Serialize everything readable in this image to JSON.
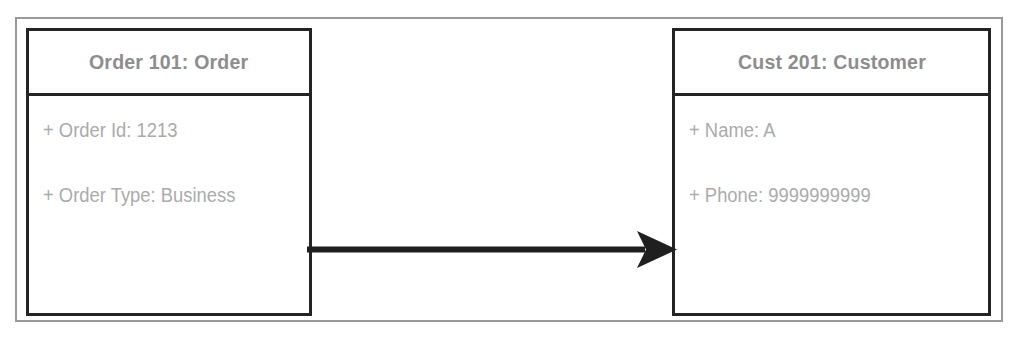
{
  "diagram": {
    "type": "uml-object-diagram",
    "background_color": "#ffffff",
    "frame_color": "#9a9a9a",
    "border_color": "#242424",
    "header_text_color": "#8d8d8d",
    "attribute_text_color": "#ababab",
    "connector_color": "#1f1f1f"
  },
  "objects": [
    {
      "id": "order",
      "header": "Order 101: Order",
      "attributes": [
        "+ Order Id: 1213",
        "+ Order Type: Business"
      ]
    },
    {
      "id": "customer",
      "header": "Cust 201: Customer",
      "attributes": [
        "+ Name: A",
        "+ Phone: 9999999999"
      ]
    }
  ],
  "connector": {
    "name": "association-arrow",
    "style": "solid",
    "arrowhead": "filled-triangle",
    "direction": "left-to-right",
    "from": "order",
    "to": "customer",
    "label": ""
  }
}
